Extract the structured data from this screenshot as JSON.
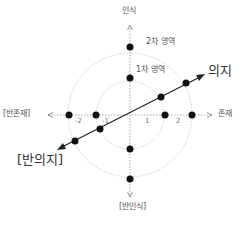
{
  "axes": {
    "top": "인식",
    "bottom": "[반인식]",
    "left": "[반존재]",
    "right": "존재",
    "diagonal_positive": "의지",
    "diagonal_negative": "[반의지]"
  },
  "regions": {
    "inner": "1차 영역",
    "outer": "2차 영역"
  },
  "ticks": [
    "-2",
    "-1",
    "1",
    "2"
  ],
  "colors": {
    "axis": "#999999",
    "circle": "#cccccc",
    "arrow": "#222222",
    "dot": "#111111"
  }
}
